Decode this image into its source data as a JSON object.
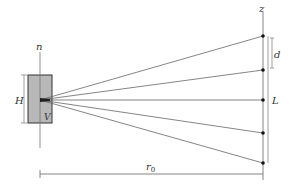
{
  "diagram": {
    "labels": {
      "n": "n",
      "z": "z",
      "d": "d",
      "H": "H",
      "V": "V",
      "L": "L",
      "r0": "r",
      "r0_sub": "0"
    },
    "colors": {
      "box_fill": "#b8b8b8",
      "line": "#555555",
      "dot": "#111111"
    },
    "receivers_y": [
      36,
      70,
      100,
      133,
      163
    ]
  }
}
